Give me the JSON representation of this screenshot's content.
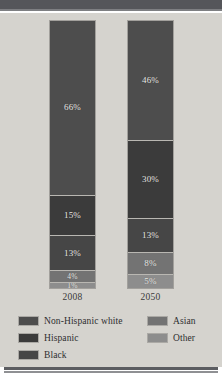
{
  "chart_data": {
    "type": "bar",
    "subtype": "stacked-100-percent",
    "title": "",
    "xlabel": "",
    "ylabel": "",
    "ylim": [
      0,
      100
    ],
    "grid": false,
    "legend_position": "bottom",
    "categories": [
      "2008",
      "2050"
    ],
    "series": [
      {
        "name": "Non-Hispanic white",
        "color": "#4d4d4d",
        "values": [
          66,
          46
        ],
        "labels": [
          "66%",
          "46%"
        ]
      },
      {
        "name": "Hispanic",
        "color": "#3b3b3b",
        "values": [
          15,
          30
        ],
        "labels": [
          "15%",
          "30%"
        ]
      },
      {
        "name": "Black",
        "color": "#464646",
        "values": [
          13,
          13
        ],
        "labels": [
          "13%",
          "13%"
        ]
      },
      {
        "name": "Asian",
        "color": "#737373",
        "values": [
          4,
          8
        ],
        "labels": [
          "4%",
          "8%"
        ]
      },
      {
        "name": "Other",
        "color": "#8d8d8d",
        "values": [
          1,
          5
        ],
        "labels": [
          "1%",
          "5%"
        ]
      }
    ]
  },
  "bars": [
    {
      "year": "2008",
      "segments": [
        {
          "name": "Non-Hispanic white",
          "value": 66,
          "label": "66%",
          "color": "#4d4d4d"
        },
        {
          "name": "Hispanic",
          "value": 15,
          "label": "15%",
          "color": "#3b3b3b"
        },
        {
          "name": "Black",
          "value": 13,
          "label": "13%",
          "color": "#464646"
        },
        {
          "name": "Asian",
          "value": 4,
          "label": "4%",
          "color": "#737373"
        },
        {
          "name": "Other",
          "value": 1,
          "label": "1%",
          "color": "#8d8d8d"
        }
      ]
    },
    {
      "year": "2050",
      "segments": [
        {
          "name": "Non-Hispanic white",
          "value": 46,
          "label": "46%",
          "color": "#4d4d4d"
        },
        {
          "name": "Hispanic",
          "value": 30,
          "label": "30%",
          "color": "#3b3b3b"
        },
        {
          "name": "Black",
          "value": 13,
          "label": "13%",
          "color": "#464646"
        },
        {
          "name": "Asian",
          "value": 8,
          "label": "8%",
          "color": "#737373"
        },
        {
          "name": "Other",
          "value": 5,
          "label": "5%",
          "color": "#8d8d8d"
        }
      ]
    }
  ],
  "legend": {
    "left_column": [
      {
        "label": "Non-Hispanic white",
        "color": "#4d4d4d"
      },
      {
        "label": "Hispanic",
        "color": "#3b3b3b"
      },
      {
        "label": "Black",
        "color": "#464646"
      }
    ],
    "right_column": [
      {
        "label": "Asian",
        "color": "#737373"
      },
      {
        "label": "Other",
        "color": "#8d8d8d"
      }
    ]
  },
  "colors": {
    "page_background": "#ffffff",
    "panel_background": "#d5d3ce",
    "top_band": "#55565a",
    "bottom_rule": "#5c5d61",
    "segment_label_text": "#e8e7e4",
    "axis_label_text": "#3a3a3a",
    "legend_text": "#2e2e2e"
  }
}
